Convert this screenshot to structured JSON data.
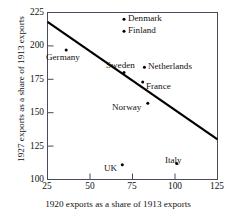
{
  "chart_data": {
    "type": "scatter",
    "title": "",
    "xlabel": "1920 exports as a share of 1913 exports",
    "ylabel": "1927 exports as a share of 1913 exports",
    "xlim": [
      25,
      125
    ],
    "ylim": [
      100,
      225
    ],
    "xticks": [
      25,
      50,
      75,
      100,
      125
    ],
    "yticks": [
      100,
      125,
      150,
      175,
      200,
      225
    ],
    "grid": false,
    "legend": "none",
    "points": [
      {
        "label": "Denmark",
        "x": 70,
        "y": 220,
        "label_pos": "right"
      },
      {
        "label": "Finland",
        "x": 70,
        "y": 211,
        "label_pos": "right"
      },
      {
        "label": "Germany",
        "x": 36,
        "y": 197,
        "label_pos": "below"
      },
      {
        "label": "Netherlands",
        "x": 82,
        "y": 184,
        "label_pos": "right"
      },
      {
        "label": "Sweden",
        "x": 70,
        "y": 180,
        "label_pos": "above"
      },
      {
        "label": "France",
        "x": 81,
        "y": 173,
        "label_pos": "right"
      },
      {
        "label": "Norway",
        "x": 84,
        "y": 157,
        "label_pos": "left"
      },
      {
        "label": "Italy",
        "x": 101,
        "y": 112,
        "label_pos": "above"
      },
      {
        "label": "UK",
        "x": 69,
        "y": 111,
        "label_pos": "left"
      }
    ],
    "trendline": {
      "x_start": 25,
      "y_start": 218,
      "x_end": 125,
      "y_end": 130,
      "color": "#000000"
    },
    "series_color": "#000000",
    "frame_color": "#4a4a5a"
  },
  "axes": {
    "ylabel": "1927 exports as a share of 1913 exports",
    "xlabel": "1920 exports as a share of 1913 exports",
    "ytick_labels": [
      "225",
      "200",
      "175",
      "150",
      "125",
      "100"
    ],
    "xtick_labels": [
      "25",
      "50",
      "75",
      "100",
      "125"
    ]
  },
  "labels": {
    "denmark": "Denmark",
    "finland": "Finland",
    "germany": "Germany",
    "netherlands": "Netherlands",
    "sweden": "Sweden",
    "france": "France",
    "norway": "Norway",
    "italy": "Italy",
    "uk": "UK"
  }
}
